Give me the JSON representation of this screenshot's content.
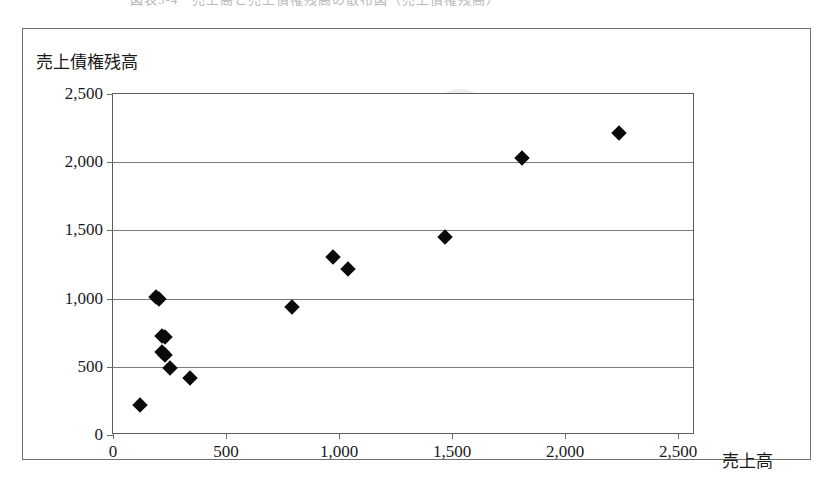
{
  "caption": {
    "text": "図表3-4　売上高と売上債権残高の散布図（売上債権残高）"
  },
  "axis_titles": {
    "y": "売上債権残高",
    "x": "売上高"
  },
  "chart_data": {
    "type": "scatter",
    "title": "",
    "xlabel": "売上高",
    "ylabel": "売上債権残高",
    "xlim": [
      0,
      2575
    ],
    "ylim": [
      0,
      2500
    ],
    "grid": true,
    "legend": false,
    "marker": "filled-diamond",
    "marker_color": "#0a0a0a",
    "xticks": [
      "0",
      "500",
      "1,000",
      "1,500",
      "2,000",
      "2,500"
    ],
    "xtick_values": [
      0,
      500,
      1000,
      1500,
      2000,
      2500
    ],
    "yticks": [
      "0",
      "500",
      "1,000",
      "1,500",
      "2,000",
      "2,500"
    ],
    "ytick_values": [
      0,
      500,
      1000,
      1500,
      2000,
      2500
    ],
    "points": [
      {
        "x": 120,
        "y": 220
      },
      {
        "x": 190,
        "y": 1010
      },
      {
        "x": 205,
        "y": 995
      },
      {
        "x": 218,
        "y": 725
      },
      {
        "x": 232,
        "y": 715
      },
      {
        "x": 218,
        "y": 605
      },
      {
        "x": 232,
        "y": 590
      },
      {
        "x": 252,
        "y": 490
      },
      {
        "x": 340,
        "y": 420
      },
      {
        "x": 790,
        "y": 940
      },
      {
        "x": 975,
        "y": 1305
      },
      {
        "x": 1040,
        "y": 1215
      },
      {
        "x": 1470,
        "y": 1450
      },
      {
        "x": 1810,
        "y": 2030
      },
      {
        "x": 2240,
        "y": 2215
      }
    ]
  }
}
